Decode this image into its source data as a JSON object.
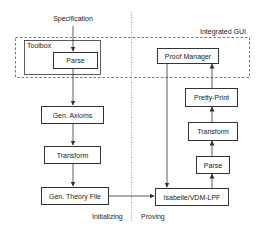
{
  "diagram": {
    "title_input": "Specification",
    "regions": {
      "integrated_gui": "Integrated GUI",
      "toolbox": "Toolbox"
    },
    "phases": {
      "left": "Initializing",
      "right": "Proving"
    },
    "left_column": {
      "parse": "Parse",
      "gen_axioms": "Gen. Axioms",
      "transform": "Transform",
      "gen_theory_file": "Gen. Theory File"
    },
    "right_column": {
      "proof_manager": "Proof Manager",
      "pretty_print": "Pretty-Print",
      "transform": "Transform",
      "parse": "Parse",
      "isabelle": "Isabelle/VDM-LPF"
    },
    "edges": [
      {
        "from": "Specification",
        "to": "Parse"
      },
      {
        "from": "Parse",
        "to": "Gen. Axioms"
      },
      {
        "from": "Gen. Axioms",
        "to": "Transform"
      },
      {
        "from": "Transform",
        "to": "Gen. Theory File"
      },
      {
        "from": "Gen. Theory File",
        "to": "Isabelle/VDM-LPF"
      },
      {
        "from": "Proof Manager",
        "to": "Isabelle/VDM-LPF"
      },
      {
        "from": "Isabelle/VDM-LPF",
        "to": "Parse"
      },
      {
        "from": "Parse",
        "to": "Transform"
      },
      {
        "from": "Transform",
        "to": "Pretty-Print"
      },
      {
        "from": "Pretty-Print",
        "to": "Proof Manager"
      }
    ],
    "colors": {
      "line": "#333333",
      "background": "#ffffff"
    }
  }
}
